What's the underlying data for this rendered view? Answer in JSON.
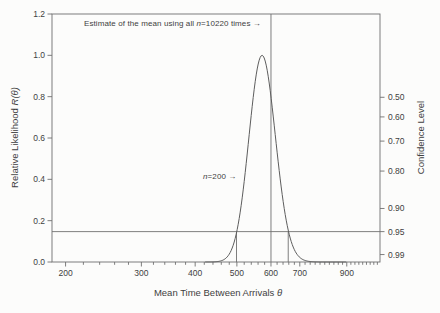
{
  "chart_data": {
    "type": "line",
    "x_axis": {
      "label_prefix": "Mean Time Between Arrivals ",
      "label_var": "θ",
      "scale": "log",
      "min": 186,
      "max": 1075,
      "major_ticks": [
        200,
        300,
        400,
        500,
        600,
        700,
        900
      ],
      "minor_tick_step": 20,
      "minor_tick_start": 180,
      "minor_tick_end": 1060
    },
    "y_axis_left": {
      "label_prefix": "Relative Likelihood ",
      "label_var": "R(θ)",
      "min": 0,
      "max": 1.2,
      "ticks": [
        "0.0",
        "0.2",
        "0.4",
        "0.6",
        "0.8",
        "1.0",
        "1.2"
      ]
    },
    "y_axis_right": {
      "label": "Confidence Level",
      "ticks": [
        {
          "label": "0.50",
          "R": 0.797
        },
        {
          "label": "0.60",
          "R": 0.702
        },
        {
          "label": "0.70",
          "R": 0.585
        },
        {
          "label": "0.80",
          "R": 0.44
        },
        {
          "label": "0.90",
          "R": 0.259
        },
        {
          "label": "0.95",
          "R": 0.147
        },
        {
          "label": "0.99",
          "R": 0.036
        }
      ]
    },
    "curve": {
      "formula": "R(theta) = ((theta_hat/theta) * exp(1 - theta_hat/theta))^n",
      "n": 200,
      "theta_hat": 572,
      "peak": {
        "theta": 572,
        "R": 1.0
      },
      "theta_plot_range": [
        422,
        900
      ]
    },
    "reference_lines": {
      "vline_theta": 600,
      "hline_R": 0.147,
      "ci95_segments_theta": [
        499,
        658
      ]
    },
    "annotations": {
      "mean_all": {
        "prefix": "Estimate of the mean using all ",
        "n_var": "n",
        "suffix": "=10220 times →"
      },
      "n200": {
        "n_var": "n",
        "suffix": "=200 →"
      }
    },
    "colors": {
      "line": "#6f6f6f",
      "curve": "#5d5d5d",
      "text": "#3f3f3f",
      "background": "#fcfcfb"
    }
  }
}
